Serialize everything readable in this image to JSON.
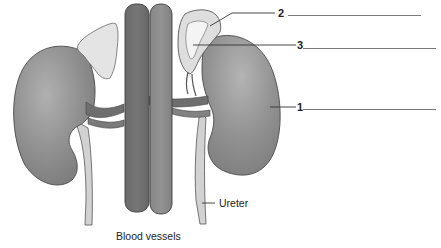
{
  "diagram": {
    "colors": {
      "kidney": "#8e8e8e",
      "kidney_highlight": "#b0b0b0",
      "adrenal": "#e2e2e2",
      "vessel_dark": "#6e6e6e",
      "vessel_light": "#8a8a8a",
      "ureter": "#d0d0d0",
      "outline": "#444444",
      "leader": "#333333"
    },
    "structures": [
      {
        "id": "left-kidney",
        "name": "Kidney (left of image)"
      },
      {
        "id": "right-kidney",
        "name": "Kidney (right of image)"
      },
      {
        "id": "left-adrenal",
        "name": "Adrenal gland (left of image)"
      },
      {
        "id": "right-adrenal",
        "name": "Adrenal gland (right of image, sectioned)"
      },
      {
        "id": "vein",
        "name": "Inferior vena cava"
      },
      {
        "id": "artery",
        "name": "Aorta"
      },
      {
        "id": "left-ureter",
        "name": "Ureter (left of image)"
      },
      {
        "id": "right-ureter",
        "name": "Ureter (right of image)"
      }
    ],
    "labels": {
      "ureter": "Ureter",
      "blood_vessels": "Blood vessels"
    },
    "numbered_labels": [
      {
        "number": "1",
        "answer": ""
      },
      {
        "number": "2",
        "answer": ""
      },
      {
        "number": "3",
        "answer": ""
      }
    ]
  }
}
